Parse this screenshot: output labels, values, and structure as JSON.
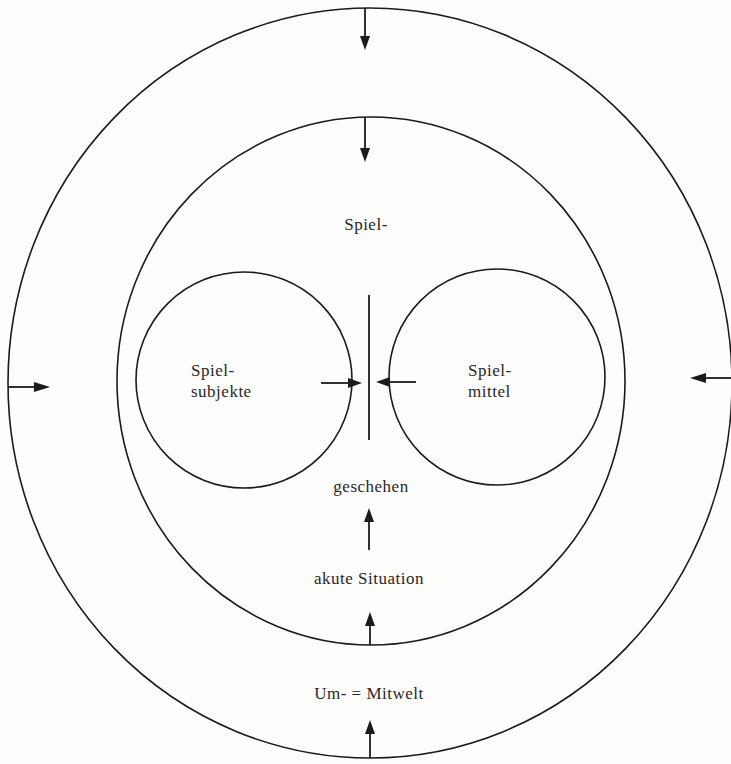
{
  "diagram": {
    "type": "nested-circles",
    "colors": {
      "stroke": "#1c1a1a",
      "text": "#2a2727",
      "background": "#fdfdfb"
    },
    "labels": {
      "spiel_prefix": "Spiel-",
      "spielsubjekte_line1": "Spiel-",
      "spielsubjekte_line2": "subjekte",
      "spielmittel_line1": "Spiel-",
      "spielmittel_line2": "mittel",
      "geschehen": "geschehen",
      "akute_situation": "akute Situation",
      "umwelt_mitwelt": "Um- = Mitwelt"
    },
    "regions": [
      {
        "name": "outer-ring",
        "label": "Um- = Mitwelt"
      },
      {
        "name": "inner-circle",
        "label": "akute Situation"
      },
      {
        "name": "left-circle",
        "label": "Spielsubjekte"
      },
      {
        "name": "right-circle",
        "label": "Spielmittel"
      },
      {
        "name": "center",
        "label": "Spielgeschehen"
      }
    ],
    "arrows": [
      {
        "name": "outer-top",
        "direction": "down"
      },
      {
        "name": "inner-top",
        "direction": "down"
      },
      {
        "name": "outer-left",
        "direction": "right"
      },
      {
        "name": "outer-right",
        "direction": "left"
      },
      {
        "name": "left-circle-to-center",
        "direction": "right"
      },
      {
        "name": "right-circle-to-center",
        "direction": "left"
      },
      {
        "name": "situation-to-geschehen",
        "direction": "up"
      },
      {
        "name": "inner-bottom",
        "direction": "up"
      },
      {
        "name": "outer-bottom",
        "direction": "up"
      }
    ]
  }
}
